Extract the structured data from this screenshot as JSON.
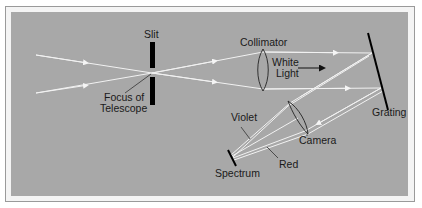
{
  "diagram": {
    "type": "spectrograph-optics",
    "colors": {
      "background": "#a8a8a8",
      "frame": "#f4f4f4",
      "ray": "#f2f2f2",
      "component": "#000000",
      "label": "#1a1a1a"
    },
    "labels": {
      "slit": "Slit",
      "focus_line1": "Focus of",
      "focus_line2": "Telescope",
      "collimator": "Collimator",
      "white_line1": "White",
      "white_line2": "Light",
      "grating": "Grating",
      "camera": "Camera",
      "violet": "Violet",
      "red": "Red",
      "spectrum": "Spectrum"
    },
    "components": [
      {
        "name": "slit",
        "label": "Slit"
      },
      {
        "name": "collimator",
        "label": "Collimator"
      },
      {
        "name": "grating",
        "label": "Grating"
      },
      {
        "name": "camera",
        "label": "Camera"
      },
      {
        "name": "spectrum",
        "label": "Spectrum"
      }
    ]
  }
}
